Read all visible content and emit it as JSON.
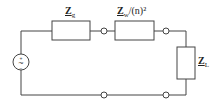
{
  "diagram": {
    "type": "circuit",
    "source": {
      "symbol": "~",
      "plus": "+",
      "minus": "−"
    },
    "impedances": [
      {
        "id": "Zg",
        "main": "Z",
        "sub": "g",
        "suffix": ""
      },
      {
        "id": "Zw",
        "main": "Z",
        "sub": "w",
        "suffix": "/(n)²"
      },
      {
        "id": "ZL",
        "main": "Z",
        "sub": "L",
        "suffix": ""
      }
    ],
    "colors": {
      "line": "#444444",
      "background": "#ffffff"
    }
  }
}
